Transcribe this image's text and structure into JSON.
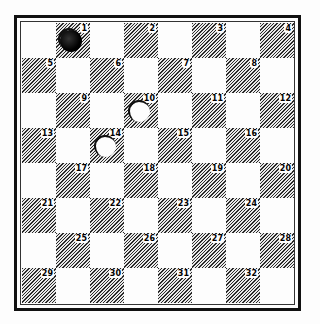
{
  "diagram": {
    "type": "checkers-board",
    "rows": 8,
    "cols": 8,
    "squares": [
      {
        "n": "1",
        "row": 0,
        "col": 1
      },
      {
        "n": "2",
        "row": 0,
        "col": 3
      },
      {
        "n": "3",
        "row": 0,
        "col": 5
      },
      {
        "n": "4",
        "row": 0,
        "col": 7
      },
      {
        "n": "5",
        "row": 1,
        "col": 0
      },
      {
        "n": "6",
        "row": 1,
        "col": 2
      },
      {
        "n": "7",
        "row": 1,
        "col": 4
      },
      {
        "n": "8",
        "row": 1,
        "col": 6
      },
      {
        "n": "9",
        "row": 2,
        "col": 1
      },
      {
        "n": "10",
        "row": 2,
        "col": 3
      },
      {
        "n": "11",
        "row": 2,
        "col": 5
      },
      {
        "n": "12",
        "row": 2,
        "col": 7
      },
      {
        "n": "13",
        "row": 3,
        "col": 0
      },
      {
        "n": "14",
        "row": 3,
        "col": 2
      },
      {
        "n": "15",
        "row": 3,
        "col": 4
      },
      {
        "n": "16",
        "row": 3,
        "col": 6
      },
      {
        "n": "17",
        "row": 4,
        "col": 1
      },
      {
        "n": "18",
        "row": 4,
        "col": 3
      },
      {
        "n": "19",
        "row": 4,
        "col": 5
      },
      {
        "n": "20",
        "row": 4,
        "col": 7
      },
      {
        "n": "21",
        "row": 5,
        "col": 0
      },
      {
        "n": "22",
        "row": 5,
        "col": 2
      },
      {
        "n": "23",
        "row": 5,
        "col": 4
      },
      {
        "n": "24",
        "row": 5,
        "col": 6
      },
      {
        "n": "25",
        "row": 6,
        "col": 1
      },
      {
        "n": "26",
        "row": 6,
        "col": 3
      },
      {
        "n": "27",
        "row": 6,
        "col": 5
      },
      {
        "n": "28",
        "row": 6,
        "col": 7
      },
      {
        "n": "29",
        "row": 7,
        "col": 0
      },
      {
        "n": "30",
        "row": 7,
        "col": 2
      },
      {
        "n": "31",
        "row": 7,
        "col": 4
      },
      {
        "n": "32",
        "row": 7,
        "col": 6
      }
    ],
    "pieces": [
      {
        "square": "1",
        "color": "black"
      },
      {
        "square": "10",
        "color": "white"
      },
      {
        "square": "14",
        "color": "white"
      }
    ],
    "colors": {
      "dark_square": "#9a9a9a",
      "light_square": "#fdfdfd",
      "black_piece": "#000000",
      "white_piece": "#fdfdfd",
      "frame": "#111111"
    }
  }
}
